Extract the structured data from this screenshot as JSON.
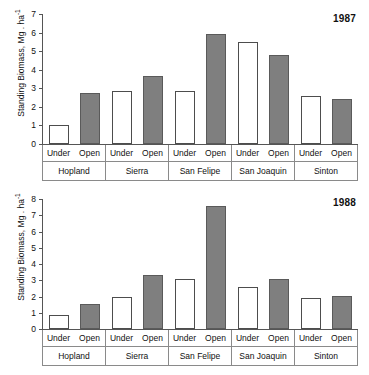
{
  "figure": {
    "ylabel": "Standing Biomass, Mg . ha",
    "ylabel_exponent": "-1",
    "sub_categories": [
      "Under",
      "Open"
    ],
    "sites": [
      "Hopland",
      "Sierra",
      "San Felipe",
      "San Joaquin",
      "Sinton"
    ],
    "colors": {
      "under_fill": "#ffffff",
      "open_fill": "#7f7f7f",
      "axis": "#555555",
      "text": "#111111"
    }
  },
  "chart_data": [
    {
      "type": "bar",
      "title": "1987",
      "xlabel": "",
      "ylabel": "Standing Biomass, Mg . ha-1",
      "ylim": [
        0,
        7
      ],
      "yticks": [
        0,
        1,
        2,
        3,
        4,
        5,
        6,
        7
      ],
      "grid": false,
      "legend": "none",
      "categories": [
        "Hopland",
        "Sierra",
        "San Felipe",
        "San Joaquin",
        "Sinton"
      ],
      "series": [
        {
          "name": "Under",
          "values": [
            1.0,
            2.85,
            2.85,
            5.5,
            2.6
          ]
        },
        {
          "name": "Open",
          "values": [
            2.75,
            3.65,
            5.9,
            4.8,
            2.4
          ]
        }
      ]
    },
    {
      "type": "bar",
      "title": "1988",
      "xlabel": "",
      "ylabel": "Standing Biomass, Mg . ha-1",
      "ylim": [
        0,
        8
      ],
      "yticks": [
        0,
        1,
        2,
        3,
        4,
        5,
        6,
        7,
        8
      ],
      "grid": false,
      "legend": "none",
      "categories": [
        "Hopland",
        "Sierra",
        "San Felipe",
        "San Joaquin",
        "Sinton"
      ],
      "series": [
        {
          "name": "Under",
          "values": [
            0.85,
            1.95,
            3.1,
            2.6,
            1.9
          ]
        },
        {
          "name": "Open",
          "values": [
            1.55,
            3.35,
            7.55,
            3.1,
            2.05
          ]
        }
      ]
    }
  ]
}
